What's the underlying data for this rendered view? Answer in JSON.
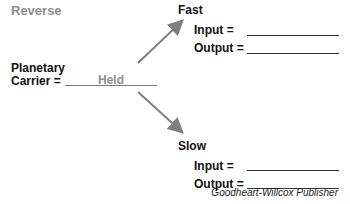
{
  "title": "Reverse",
  "planetary_carrier": {
    "label_line1": "Planetary",
    "label_line2": "Carrier =",
    "value": "Held"
  },
  "branches": [
    {
      "name": "Fast",
      "input_label": "Input =",
      "input_value": "",
      "output_label": "Output =",
      "output_value": ""
    },
    {
      "name": "Slow",
      "input_label": "Input =",
      "input_value": "",
      "output_label": "Output =",
      "output_value": ""
    }
  ],
  "credit": "Goodheart-Willcox Publisher",
  "colors": {
    "arrow": "#808080",
    "muted_text": "#8e8e8e"
  }
}
